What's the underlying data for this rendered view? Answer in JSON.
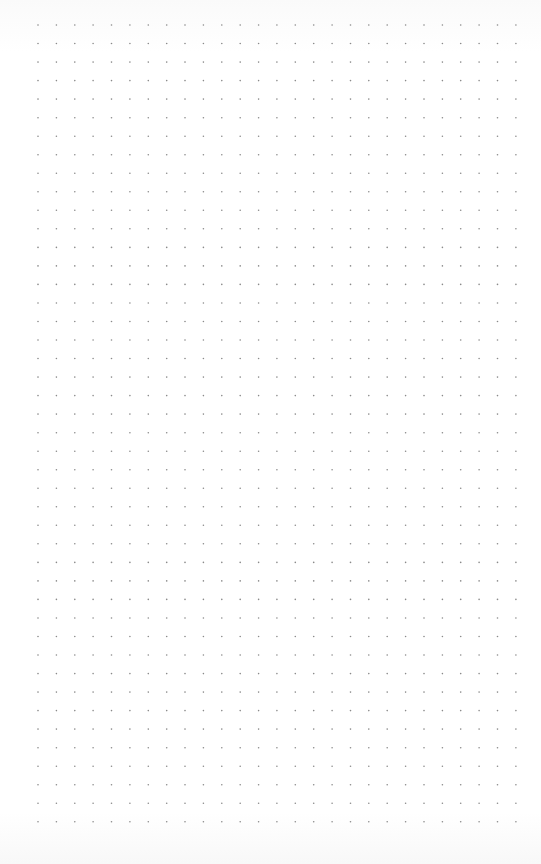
{
  "page": {
    "type": "dot-grid paper",
    "background": "#ffffff"
  },
  "grid": {
    "columns": 27,
    "rows": 44,
    "origin_x": 38,
    "origin_y": 25,
    "spacing_x": 18.38,
    "spacing_y": 18.53,
    "dot_radius": 0.8,
    "dot_color": "#8a8a8a"
  }
}
